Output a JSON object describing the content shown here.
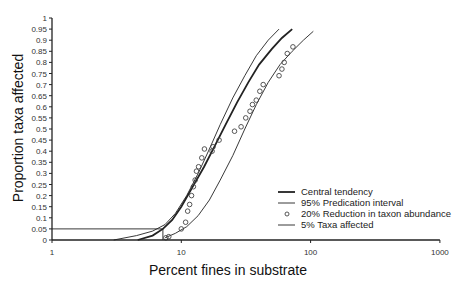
{
  "chart_data": {
    "type": "line",
    "title": "",
    "xlabel": "Percent fines in substrate",
    "ylabel": "Proportion taxa affected",
    "xscale": "log",
    "xlim": [
      1,
      1000
    ],
    "ylim": [
      0,
      1
    ],
    "x_ticks": [
      "1",
      "10",
      "100",
      "1000"
    ],
    "y_ticks": [
      "0",
      "0.05",
      "0.1",
      "0.15",
      "0.2",
      "0.25",
      "0.3",
      "0.35",
      "0.4",
      "0.45",
      "0.5",
      "0.55",
      "0.6",
      "0.65",
      "0.7",
      "0.75",
      "0.8",
      "0.85",
      "0.9",
      "0.95",
      "1"
    ],
    "grid": false,
    "legend_position": "lower right",
    "series": [
      {
        "name": "Central tendency",
        "style": "thick-line",
        "x": [
          4.6,
          6.0,
          7.2,
          8.5,
          10.0,
          12.0,
          15.0,
          18.0,
          22.0,
          27.0,
          33.0,
          40.0,
          50.0,
          60.0,
          72.0
        ],
        "y": [
          0.0,
          0.02,
          0.05,
          0.09,
          0.15,
          0.23,
          0.33,
          0.42,
          0.52,
          0.62,
          0.71,
          0.79,
          0.86,
          0.91,
          0.95
        ]
      },
      {
        "name": "95% Predication interval (upper)",
        "style": "thin-line",
        "x": [
          3.0,
          4.5,
          6.0,
          7.5,
          9.0,
          11.0,
          13.5,
          16.5,
          20.0,
          25.0,
          31.0,
          38.0,
          47.0,
          57.0
        ],
        "y": [
          0.0,
          0.02,
          0.04,
          0.07,
          0.12,
          0.2,
          0.3,
          0.41,
          0.52,
          0.64,
          0.74,
          0.83,
          0.9,
          0.95
        ]
      },
      {
        "name": "95% Predication interval (lower)",
        "style": "thin-line",
        "x": [
          7.5,
          9.0,
          11.0,
          13.5,
          16.5,
          20.0,
          25.0,
          31.0,
          38.0,
          47.0,
          58.0,
          72.0,
          88.0,
          105.0
        ],
        "y": [
          0.01,
          0.03,
          0.06,
          0.11,
          0.18,
          0.27,
          0.38,
          0.5,
          0.61,
          0.71,
          0.79,
          0.85,
          0.9,
          0.94
        ]
      },
      {
        "name": "20% Reduction in taxon abundance",
        "style": "circle-marker",
        "x": [
          7.6,
          8.0,
          10.0,
          10.8,
          11.2,
          11.6,
          12.0,
          12.4,
          12.8,
          13.1,
          13.6,
          14.4,
          15.1,
          17.3,
          17.6,
          19.6,
          25.8,
          29.0,
          31.5,
          34.0,
          35.5,
          38.0,
          40.5,
          43.0,
          57.0,
          60.0,
          62.5,
          66.0,
          73.0
        ],
        "y": [
          0.01,
          0.015,
          0.05,
          0.08,
          0.13,
          0.16,
          0.2,
          0.24,
          0.27,
          0.31,
          0.33,
          0.37,
          0.41,
          0.4,
          0.42,
          0.45,
          0.49,
          0.51,
          0.55,
          0.58,
          0.61,
          0.63,
          0.67,
          0.7,
          0.74,
          0.77,
          0.8,
          0.84,
          0.87
        ]
      },
      {
        "name": "5% Taxa affected",
        "style": "thin-line",
        "x": [
          1,
          7.2,
          7.2
        ],
        "y": [
          0.05,
          0.05,
          0.0
        ]
      }
    ],
    "legend": [
      {
        "label": "Central tendency",
        "marker": "thick-line"
      },
      {
        "label": "95% Predication interval",
        "marker": "thin-line"
      },
      {
        "label": "20% Reduction in taxon abundance",
        "marker": "circle"
      },
      {
        "label": "5% Taxa affected",
        "marker": "thin-line"
      }
    ]
  }
}
